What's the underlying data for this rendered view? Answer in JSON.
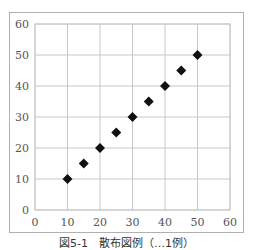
{
  "chart_data": {
    "type": "scatter",
    "title": "",
    "xlabel": "",
    "ylabel": "",
    "x": [
      10,
      15,
      20,
      25,
      30,
      35,
      40,
      45,
      50
    ],
    "y": [
      10,
      15,
      20,
      25,
      30,
      35,
      40,
      45,
      50
    ],
    "xlim": [
      0,
      60
    ],
    "ylim": [
      0,
      60
    ],
    "x_ticks": [
      0,
      10,
      20,
      30,
      40,
      50,
      60
    ],
    "y_ticks": [
      0,
      10,
      20,
      30,
      40,
      50,
      60
    ],
    "grid": true,
    "legend": null,
    "marker": "diamond",
    "marker_color": "#111111",
    "grid_color": "#c8c8c8"
  },
  "caption": "図5-1　散布図例（…1例）"
}
